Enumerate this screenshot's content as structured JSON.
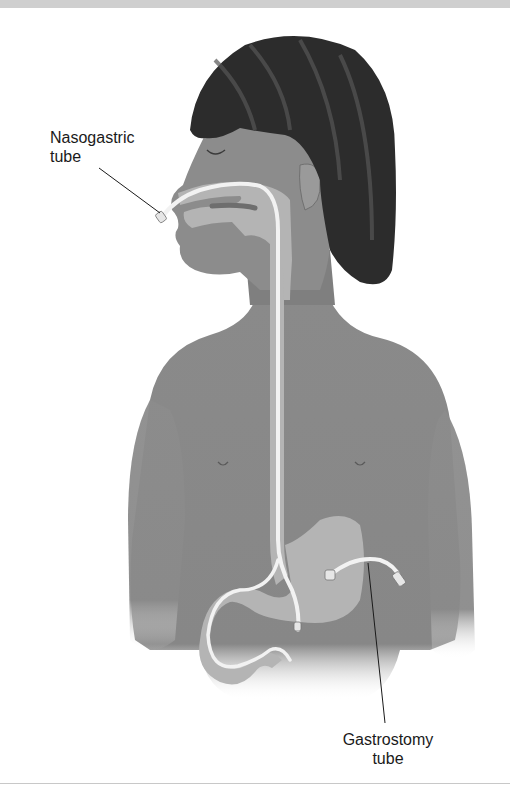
{
  "figure": {
    "labels": {
      "nasogastric": {
        "line1": "Nasogastric",
        "line2": "tube"
      },
      "gastrostomy": {
        "line1": "Gastrostomy",
        "line2": "tube"
      }
    },
    "colors": {
      "background": "#ffffff",
      "skin": "#8a8a8a",
      "skin_shadow": "#6e6e6e",
      "hair": "#2a2a2a",
      "organ": "#b4b4b4",
      "tube": "#f2f2f2",
      "leader_line": "#1a1a1a",
      "top_band": "#cfcfcf"
    }
  }
}
